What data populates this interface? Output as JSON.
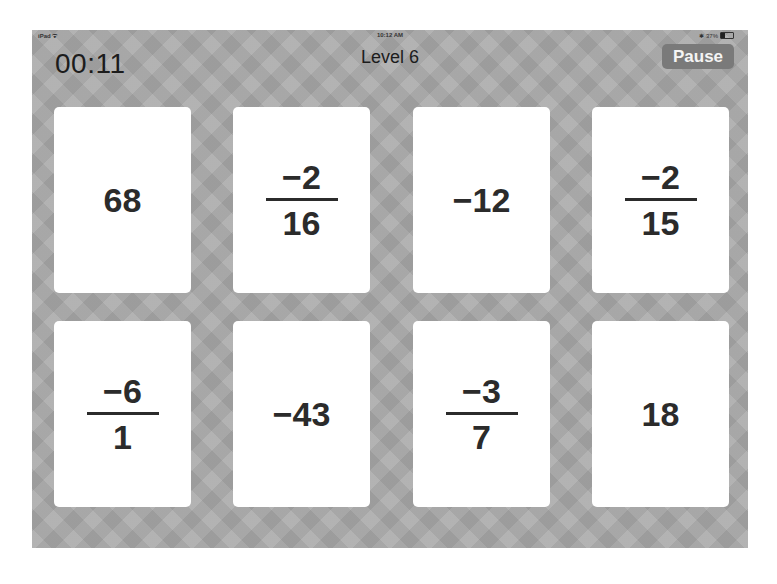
{
  "status_bar": {
    "carrier": "iPad ᯤ",
    "time": "10:12 AM",
    "battery_text": "37%",
    "battery_percent": 37
  },
  "header": {
    "timer": "00:11",
    "level": "Level 6",
    "pause_label": "Pause"
  },
  "cards": [
    {
      "type": "whole",
      "value": "68"
    },
    {
      "type": "fraction",
      "numerator": "−2",
      "denominator": "16"
    },
    {
      "type": "whole",
      "value": "−12"
    },
    {
      "type": "fraction",
      "numerator": "−2",
      "denominator": "15"
    },
    {
      "type": "fraction",
      "numerator": "−6",
      "denominator": "1"
    },
    {
      "type": "whole",
      "value": "−43"
    },
    {
      "type": "fraction",
      "numerator": "−3",
      "denominator": "7"
    },
    {
      "type": "whole",
      "value": "18"
    }
  ],
  "colors": {
    "background": "#a9a9a9",
    "card": "#ffffff",
    "text": "#2b2b2b",
    "pause_button": "#7a7a7a"
  }
}
